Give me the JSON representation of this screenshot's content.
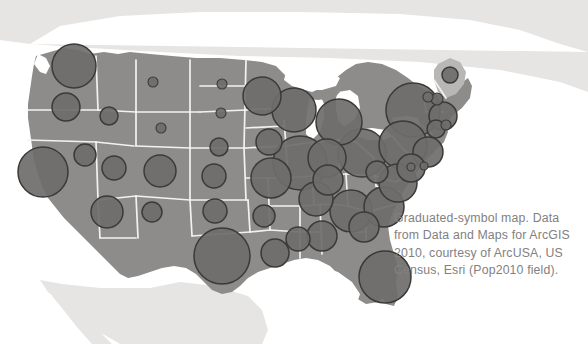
{
  "figure": {
    "type": "graduated-symbol-map",
    "caption": "Graduated-symbol map. Data\nfrom Data and Maps for ArcGIS\n2010, courtesy of ArcUSA, US\nCensus, Esri (Pop2010 field).",
    "caption_lines": [
      "Graduated-symbol map. Data",
      "from Data and Maps for ArcGIS",
      "2010, courtesy of ArcUSA, US",
      "Census, Esri (Pop2010 field)."
    ]
  },
  "colors": {
    "background": "#ffffff",
    "us_land": "#8d8c8a",
    "neighbor_land": "#e6e5e4",
    "state_border": "#f2f2f0",
    "water": "#ffffff",
    "symbol_fill": "#6e6d6b",
    "symbol_stroke": "#3a3a38",
    "caption_text": "#82817f"
  },
  "chart_data": {
    "type": "scatter",
    "title": "Graduated-symbol map",
    "field": "Pop2010",
    "source": "Data and Maps for ArcGIS 2010, ArcUSA, US Census, Esri",
    "xlabel": "",
    "ylabel": "",
    "symbols": [
      {
        "name": "Washington",
        "x": 74,
        "y": 66,
        "r": 22
      },
      {
        "name": "Oregon",
        "x": 66,
        "y": 107,
        "r": 14
      },
      {
        "name": "Idaho",
        "x": 109,
        "y": 116,
        "r": 9
      },
      {
        "name": "Montana",
        "x": 153,
        "y": 82,
        "r": 5
      },
      {
        "name": "Wyoming",
        "x": 161,
        "y": 128,
        "r": 5
      },
      {
        "name": "North Dakota",
        "x": 222,
        "y": 84,
        "r": 5
      },
      {
        "name": "South Dakota",
        "x": 221,
        "y": 113,
        "r": 5
      },
      {
        "name": "Nebraska",
        "x": 219,
        "y": 147,
        "r": 9
      },
      {
        "name": "Minnesota",
        "x": 262,
        "y": 96,
        "r": 19
      },
      {
        "name": "Iowa",
        "x": 269,
        "y": 142,
        "r": 13
      },
      {
        "name": "Wisconsin",
        "x": 294,
        "y": 110,
        "r": 22
      },
      {
        "name": "Illinois",
        "x": 300,
        "y": 163,
        "r": 27
      },
      {
        "name": "Missouri",
        "x": 271,
        "y": 178,
        "r": 20
      },
      {
        "name": "Kansas",
        "x": 214,
        "y": 176,
        "r": 12
      },
      {
        "name": "Colorado",
        "x": 160,
        "y": 171,
        "r": 16
      },
      {
        "name": "Utah",
        "x": 114,
        "y": 168,
        "r": 12
      },
      {
        "name": "Nevada",
        "x": 85,
        "y": 155,
        "r": 11
      },
      {
        "name": "California",
        "x": 43,
        "y": 172,
        "r": 25
      },
      {
        "name": "Arizona",
        "x": 107,
        "y": 212,
        "r": 16
      },
      {
        "name": "New Mexico",
        "x": 152,
        "y": 212,
        "r": 10
      },
      {
        "name": "Oklahoma",
        "x": 215,
        "y": 211,
        "r": 12
      },
      {
        "name": "Texas",
        "x": 222,
        "y": 256,
        "r": 28
      },
      {
        "name": "Arkansas",
        "x": 264,
        "y": 216,
        "r": 11
      },
      {
        "name": "Louisiana",
        "x": 275,
        "y": 253,
        "r": 14
      },
      {
        "name": "Mississippi",
        "x": 298,
        "y": 239,
        "r": 12
      },
      {
        "name": "Alabama",
        "x": 322,
        "y": 236,
        "r": 15
      },
      {
        "name": "Tennessee",
        "x": 316,
        "y": 199,
        "r": 17
      },
      {
        "name": "Kentucky",
        "x": 328,
        "y": 180,
        "r": 15
      },
      {
        "name": "Indiana",
        "x": 327,
        "y": 158,
        "r": 19
      },
      {
        "name": "Michigan",
        "x": 339,
        "y": 122,
        "r": 23
      },
      {
        "name": "Ohio",
        "x": 362,
        "y": 153,
        "r": 24
      },
      {
        "name": "West Virginia",
        "x": 377,
        "y": 172,
        "r": 11
      },
      {
        "name": "Virginia",
        "x": 398,
        "y": 183,
        "r": 19
      },
      {
        "name": "North Carolina",
        "x": 384,
        "y": 207,
        "r": 20
      },
      {
        "name": "South Carolina",
        "x": 364,
        "y": 227,
        "r": 15
      },
      {
        "name": "Georgia",
        "x": 351,
        "y": 211,
        "r": 21
      },
      {
        "name": "Florida",
        "x": 385,
        "y": 277,
        "r": 26
      },
      {
        "name": "Pennsylvania",
        "x": 403,
        "y": 145,
        "r": 24
      },
      {
        "name": "New York",
        "x": 413,
        "y": 110,
        "r": 27
      },
      {
        "name": "New Jersey",
        "x": 428,
        "y": 152,
        "r": 15
      },
      {
        "name": "Maryland",
        "x": 411,
        "y": 168,
        "r": 14
      },
      {
        "name": "District of Columbia",
        "x": 411,
        "y": 167,
        "r": 4
      },
      {
        "name": "Delaware",
        "x": 424,
        "y": 166,
        "r": 4
      },
      {
        "name": "Connecticut",
        "x": 436,
        "y": 129,
        "r": 9
      },
      {
        "name": "Rhode Island",
        "x": 446,
        "y": 125,
        "r": 5
      },
      {
        "name": "Massachusetts",
        "x": 443,
        "y": 116,
        "r": 14
      },
      {
        "name": "Vermont",
        "x": 428,
        "y": 97,
        "r": 5
      },
      {
        "name": "New Hampshire",
        "x": 437,
        "y": 99,
        "r": 6
      },
      {
        "name": "Maine",
        "x": 450,
        "y": 75,
        "r": 8
      }
    ]
  }
}
